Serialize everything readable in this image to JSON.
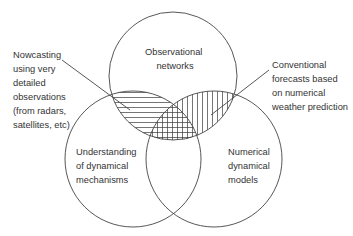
{
  "diagram": {
    "type": "venn",
    "colors": {
      "line": "#444444",
      "text": "#333333",
      "background": "#ffffff"
    },
    "circles": [
      {
        "id": "top",
        "label_lines": [
          "Observational",
          "networks"
        ]
      },
      {
        "id": "left",
        "label_lines": [
          "Understanding",
          "of dynamical",
          "mechanisms"
        ]
      },
      {
        "id": "right",
        "label_lines": [
          "Numerical",
          "dynamical",
          "models"
        ]
      }
    ],
    "callouts": [
      {
        "id": "nowcasting",
        "target": "top ∩ left",
        "hatch": "horizontal",
        "label_lines": [
          "Nowcasting",
          "using very",
          "detailed",
          "observations",
          "(from radars,",
          "satellites, etc)"
        ]
      },
      {
        "id": "conventional",
        "target": "top ∩ right",
        "hatch": "vertical",
        "label_lines": [
          "Conventional",
          "forecasts based",
          "on numerical",
          "weather prediction"
        ]
      }
    ],
    "center_region": {
      "target": "top ∩ left ∩ right",
      "hatch": "cross"
    }
  }
}
